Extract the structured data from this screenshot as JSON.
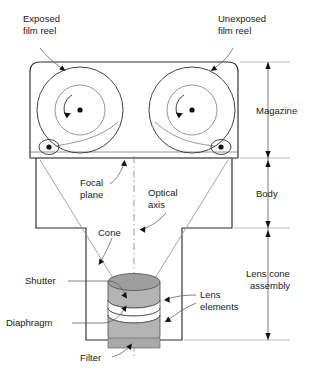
{
  "diagram": {
    "labels": {
      "exposed_reel_l1": "Exposed",
      "exposed_reel_l2": "film reel",
      "unexposed_reel_l1": "Unexposed",
      "unexposed_reel_l2": "film reel",
      "focal_plane_l1": "Focal",
      "focal_plane_l2": "plane",
      "optical_axis_l1": "Optical",
      "optical_axis_l2": "axis",
      "cone": "Cone",
      "shutter": "Shutter",
      "diaphragm": "Diaphragm",
      "filter": "Filter",
      "lens_elements_l1": "Lens",
      "lens_elements_l2": "elements"
    },
    "dimensions": [
      {
        "name": "magazine",
        "label": "Magazine"
      },
      {
        "name": "body",
        "label": "Body"
      },
      {
        "name": "lens-cone-assembly",
        "label_l1": "Lens cone",
        "label_l2": "assembly"
      }
    ],
    "colors": {
      "background": "#ffffff",
      "outline": "#2a2a2a",
      "thin_line": "#6e6e6e",
      "text": "#1a1a1a",
      "glass_light": "#9e9e9e",
      "glass_mid": "#b4b4b4",
      "filter": "#a8a8a8",
      "dimension": "#555555"
    }
  }
}
